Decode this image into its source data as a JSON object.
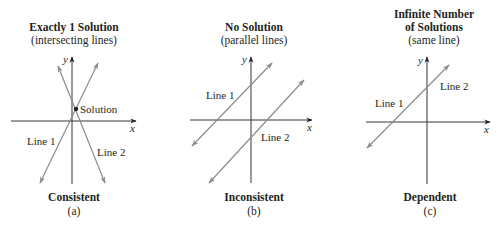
{
  "panels": [
    {
      "id": "a",
      "title": "Exactly 1 Solution",
      "subtitle": "(intersecting lines)",
      "classification": "Consistent",
      "letter": "(a)",
      "line1_label": "Line 1",
      "line2_label": "Line 2",
      "point_label": "Solution",
      "x_axis_label": "x",
      "y_axis_label": "y"
    },
    {
      "id": "b",
      "title": "No Solution",
      "subtitle": "(parallel lines)",
      "classification": "Inconsistent",
      "letter": "(b)",
      "line1_label": "Line 1",
      "line2_label": "Line 2",
      "x_axis_label": "x",
      "y_axis_label": "y"
    },
    {
      "id": "c",
      "title_line1": "Infinite Number",
      "title_line2": "of Solutions",
      "subtitle": "(same line)",
      "classification": "Dependent",
      "letter": "(c)",
      "line1_label": "Line 1",
      "line2_label": "Line 2",
      "x_axis_label": "x",
      "y_axis_label": "y"
    }
  ],
  "colors": {
    "axis": "#231f20",
    "line": "#8a8c8e",
    "text": "#231f20"
  }
}
